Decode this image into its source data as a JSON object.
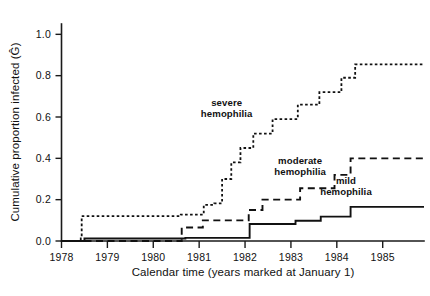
{
  "chart_data": {
    "type": "line",
    "title": "",
    "subtitle": "",
    "xlabel": "Calendar time (years marked at January 1)",
    "ylabel": "Cumulative proportion infected (Ĝ)",
    "ylabel_plain": "Cumulative proportion infected (G-hat)",
    "xlim": [
      1978.0,
      1985.9
    ],
    "ylim": [
      0.0,
      1.05
    ],
    "grid": false,
    "legend_position": "inline-annotations",
    "step_style": "post",
    "xticks": [
      1978,
      1979,
      1980,
      1981,
      1982,
      1983,
      1984,
      1985
    ],
    "xtick_labels": [
      "1978",
      "1979",
      "1980",
      "1981",
      "1982",
      "1983",
      "1984",
      "1985"
    ],
    "yticks": [
      0.0,
      0.2,
      0.4,
      0.6,
      0.8,
      1.0
    ],
    "ytick_labels": [
      "0.0",
      "0.2",
      "0.4",
      "0.6",
      "0.8",
      "1.0"
    ],
    "series": [
      {
        "name": "severe hemophilia",
        "line_style": "dotted",
        "final_value": 0.855,
        "x": [
          1978.0,
          1978.28,
          1978.42,
          1978.44,
          1980.44,
          1980.6,
          1981.03,
          1981.1,
          1981.3,
          1981.33,
          1981.44,
          1981.5,
          1981.62,
          1981.7,
          1981.82,
          1981.9,
          1982.1,
          1982.18,
          1982.52,
          1982.6,
          1983.05,
          1983.15,
          1983.55,
          1983.62,
          1984.02,
          1984.1,
          1984.4,
          1985.9
        ],
        "y": [
          0.0,
          0.0,
          0.012,
          0.12,
          0.12,
          0.128,
          0.128,
          0.175,
          0.175,
          0.182,
          0.182,
          0.3,
          0.3,
          0.38,
          0.38,
          0.45,
          0.45,
          0.52,
          0.52,
          0.59,
          0.59,
          0.66,
          0.66,
          0.72,
          0.72,
          0.79,
          0.855,
          0.855
        ]
      },
      {
        "name": "moderate hemophilia",
        "line_style": "dashed",
        "final_value": 0.4,
        "x": [
          1978.0,
          1980.55,
          1980.62,
          1981.0,
          1981.08,
          1982.0,
          1982.08,
          1982.3,
          1982.38,
          1983.1,
          1983.2,
          1983.8,
          1983.95,
          1984.3,
          1985.9
        ],
        "y": [
          0.0,
          0.0,
          0.065,
          0.065,
          0.1,
          0.1,
          0.15,
          0.15,
          0.2,
          0.2,
          0.255,
          0.255,
          0.32,
          0.4,
          0.4
        ]
      },
      {
        "name": "mild hemophilia",
        "line_style": "solid",
        "final_value": 0.165,
        "x": [
          1978.0,
          1978.3,
          1978.5,
          1980.5,
          1980.7,
          1982.0,
          1982.1,
          1983.0,
          1983.1,
          1983.55,
          1983.65,
          1984.1,
          1984.3,
          1985.9
        ],
        "y": [
          0.0,
          0.0,
          0.012,
          0.012,
          0.015,
          0.015,
          0.082,
          0.082,
          0.098,
          0.098,
          0.118,
          0.118,
          0.165,
          0.165
        ]
      }
    ],
    "annotations": [
      {
        "text_line1": "severe",
        "text_line2": "hemophilia",
        "x": 1981.6,
        "y": 0.655,
        "series": "severe hemophilia"
      },
      {
        "text_line1": "moderate",
        "text_line2": "hemophilia",
        "x": 1983.2,
        "y": 0.375,
        "series": "moderate hemophilia"
      },
      {
        "text_line1": "mild",
        "text_line2": "hemophilia",
        "x": 1984.2,
        "y": 0.275,
        "series": "mild hemophilia"
      }
    ],
    "colors": {
      "line": "#111111",
      "axis": "#1a1a1a",
      "background": "#ffffff"
    }
  }
}
